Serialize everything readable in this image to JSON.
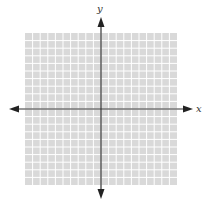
{
  "diagram": {
    "type": "coordinate-plane",
    "top_text_cutoff": "",
    "axes": {
      "x_label": "x",
      "y_label": "y",
      "arrows": "both-directions"
    },
    "grid": {
      "x_range": [
        -10,
        10
      ],
      "y_range": [
        -10,
        10
      ],
      "cells_per_side": 20,
      "fill_color": "#d9d9d9",
      "line_color": "#ffffff",
      "axis_color": "#333333"
    }
  }
}
